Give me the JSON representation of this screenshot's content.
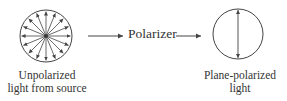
{
  "diagram": {
    "source": {
      "label_line1": "Unpolarized",
      "label_line2": "light from source",
      "icon": "unpolarized-light-radial-arrows"
    },
    "filter": {
      "label": "Polarizer"
    },
    "output": {
      "label_line1": "Plane-polarized",
      "label_line2": "light",
      "icon": "vertical-double-arrow"
    },
    "colors": {
      "stroke": "#444444",
      "text": "#333333",
      "background": "#ffffff"
    }
  }
}
